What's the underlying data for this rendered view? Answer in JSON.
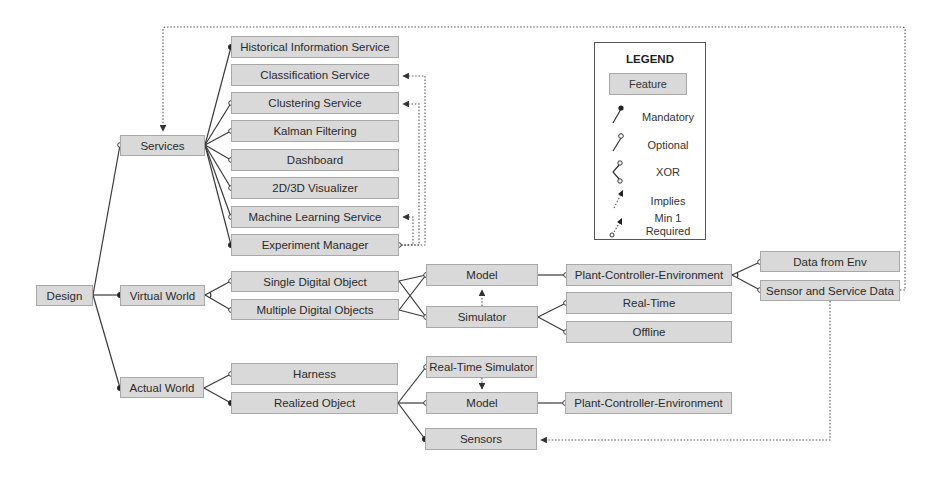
{
  "diagram": {
    "type": "feature-model",
    "root": "Design",
    "colors": {
      "feature_fill": "#d9d9d9",
      "feature_border": "#a8a8a8",
      "line": "#3a3a3a",
      "text": "#2a2a2a"
    },
    "features": {
      "design": "Design",
      "services": "Services",
      "virtual_world": "Virtual World",
      "actual_world": "Actual World",
      "historical_information_service": "Historical Information Service",
      "classification_service": "Classification Service",
      "clustering_service": "Clustering Service",
      "kalman_filtering": "Kalman Filtering",
      "dashboard": "Dashboard",
      "visualizer_2d3d": "2D/3D Visualizer",
      "machine_learning_service": "Machine Learning Service",
      "experiment_manager": "Experiment Manager",
      "single_digital_object": "Single Digital Object",
      "multiple_digital_objects": "Multiple Digital Objects",
      "harness": "Harness",
      "realized_object": "Realized Object",
      "vw_model": "Model",
      "vw_simulator": "Simulator",
      "real_time_simulator": "Real-Time Simulator",
      "aw_model": "Model",
      "sensors": "Sensors",
      "vw_plant_controller_environment": "Plant-Controller-Environment",
      "real_time": "Real-Time",
      "offline": "Offline",
      "aw_plant_controller_environment": "Plant-Controller-Environment",
      "data_from_env": "Data from Env",
      "sensor_and_service_data": "Sensor and Service Data"
    },
    "relations": [
      {
        "from": "Design",
        "to": "Services",
        "type": "optional"
      },
      {
        "from": "Design",
        "to": "Virtual World",
        "type": "mandatory"
      },
      {
        "from": "Design",
        "to": "Actual World",
        "type": "mandatory"
      },
      {
        "from": "Services",
        "to": "Historical Information Service",
        "type": "mandatory"
      },
      {
        "from": "Services",
        "to": "Clustering Service",
        "type": "optional"
      },
      {
        "from": "Services",
        "to": "Kalman Filtering",
        "type": "optional"
      },
      {
        "from": "Services",
        "to": "Dashboard",
        "type": "optional"
      },
      {
        "from": "Services",
        "to": "2D/3D Visualizer",
        "type": "optional"
      },
      {
        "from": "Services",
        "to": "Machine Learning Service",
        "type": "optional"
      },
      {
        "from": "Services",
        "to": "Experiment Manager",
        "type": "mandatory"
      },
      {
        "from": "Virtual World",
        "to": [
          "Single Digital Object",
          "Multiple Digital Objects"
        ],
        "type": "xor"
      },
      {
        "from": "Single Digital Object",
        "to": "Model",
        "type": "optional"
      },
      {
        "from": "Single Digital Object",
        "to": "Simulator",
        "type": "optional"
      },
      {
        "from": "Multiple Digital Objects",
        "to": "Model",
        "type": "optional"
      },
      {
        "from": "Multiple Digital Objects",
        "to": "Simulator",
        "type": "optional"
      },
      {
        "from": "Model",
        "to": "Plant-Controller-Environment",
        "type": "optional"
      },
      {
        "from": "Simulator",
        "to": "Real-Time",
        "type": "optional"
      },
      {
        "from": "Simulator",
        "to": "Offline",
        "type": "optional"
      },
      {
        "from": "Simulator",
        "to": "Model",
        "type": "implies"
      },
      {
        "from": "Plant-Controller-Environment",
        "to": [
          "Data from Env",
          "Sensor and Service Data"
        ],
        "type": "xor"
      },
      {
        "from": "Actual World",
        "to": "Harness",
        "type": "optional"
      },
      {
        "from": "Actual World",
        "to": "Realized Object",
        "type": "mandatory"
      },
      {
        "from": "Realized Object",
        "to": "Real-Time Simulator",
        "type": "optional"
      },
      {
        "from": "Realized Object",
        "to": "Model",
        "type": "optional"
      },
      {
        "from": "Realized Object",
        "to": "Sensors",
        "type": "mandatory"
      },
      {
        "from": "Real-Time Simulator",
        "to": "Model",
        "type": "implies"
      },
      {
        "from": "Model",
        "to": "Plant-Controller-Environment",
        "type": "optional"
      },
      {
        "from": "Experiment Manager",
        "to": [
          "Classification Service",
          "Clustering Service",
          "Machine Learning Service"
        ],
        "type": "min-1-required"
      },
      {
        "from": "Sensor and Service Data",
        "to": "Services",
        "type": "implies"
      },
      {
        "from": "Sensor and Service Data",
        "to": "Sensors",
        "type": "implies"
      }
    ]
  },
  "legend": {
    "title": "LEGEND",
    "feature": "Feature",
    "mandatory": "Mandatory",
    "optional": "Optional",
    "xor": "XOR",
    "implies": "Implies",
    "min1_line1": "Min 1",
    "min1_line2": "Required"
  }
}
